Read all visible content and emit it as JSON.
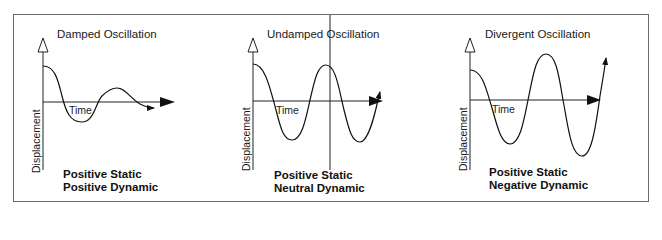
{
  "figure": {
    "panels": [
      {
        "title": "Damped Oscillation",
        "x_label": "Time",
        "y_label": "Displacement",
        "stability_line1": "Positive Static",
        "stability_line2": "Positive Dynamic",
        "behavior": "damped"
      },
      {
        "title": "Undamped Oscillation",
        "x_label": "Time",
        "y_label": "Displacement",
        "stability_line1": "Positive Static",
        "stability_line2": "Neutral Dynamic",
        "behavior": "undamped"
      },
      {
        "title": "Divergent Oscillation",
        "x_label": "Time",
        "y_label": "Displacement",
        "stability_line1": "Positive Static",
        "stability_line2": "Negative Dynamic",
        "behavior": "divergent"
      }
    ],
    "colors": {
      "line": "#1a1a1a",
      "frame": "#6a6a6a",
      "background": "#ffffff"
    }
  }
}
